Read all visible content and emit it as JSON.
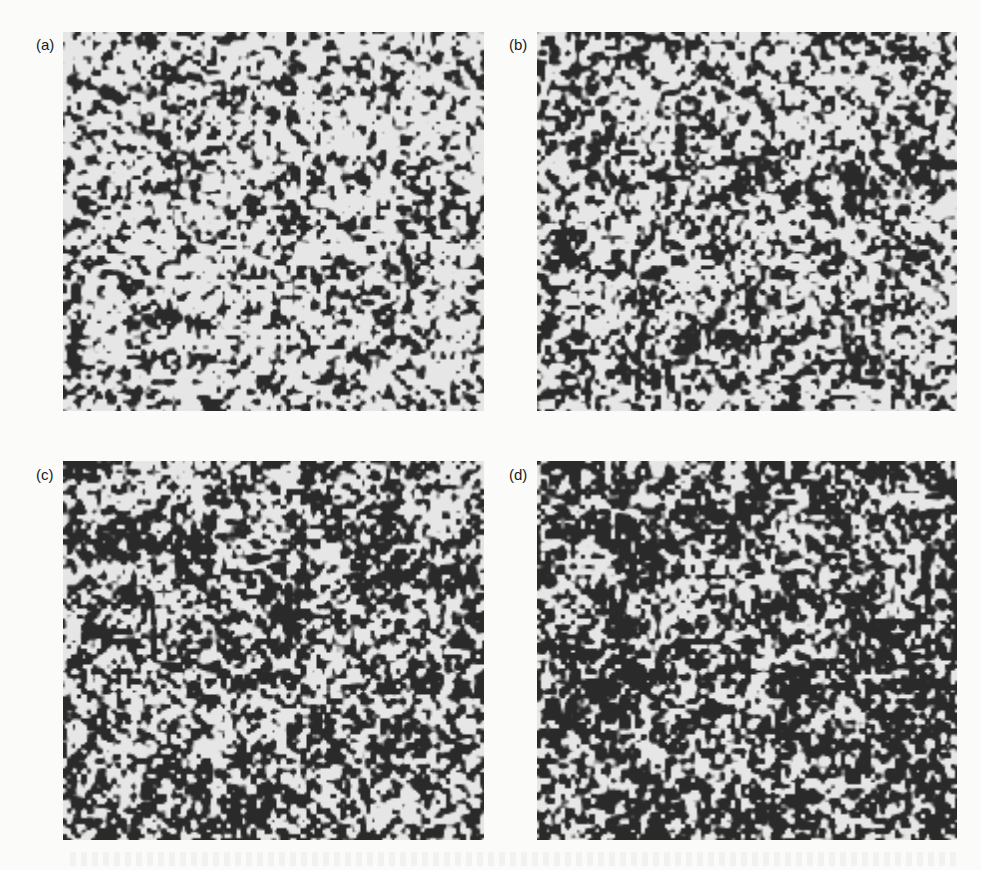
{
  "figure": {
    "panels": [
      {
        "label": "(a)",
        "id": "a",
        "dark_fraction": 0.3,
        "seed": 11
      },
      {
        "label": "(b)",
        "id": "b",
        "dark_fraction": 0.4,
        "seed": 23
      },
      {
        "label": "(c)",
        "id": "c",
        "dark_fraction": 0.52,
        "seed": 37
      },
      {
        "label": "(d)",
        "id": "d",
        "dark_fraction": 0.64,
        "seed": 51
      }
    ],
    "colors": {
      "dark": "#2a2a2a",
      "light": "#e6e6e6",
      "background": "#fbfbfa"
    }
  }
}
